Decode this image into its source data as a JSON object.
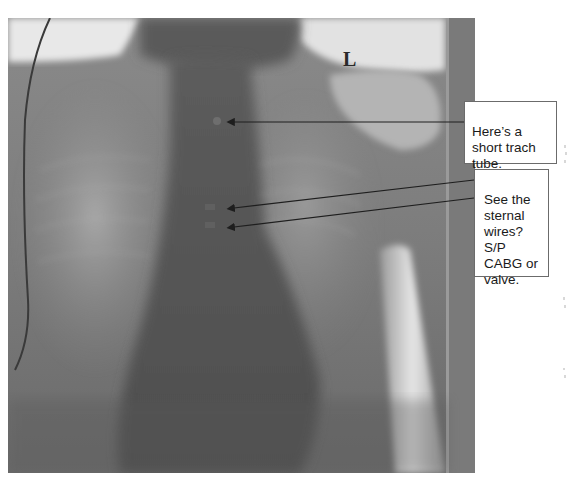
{
  "figure": {
    "side_marker": "L"
  },
  "annotations": [
    {
      "id": "trach",
      "text": "Here’s a\nshort trach\ntube.",
      "arrow_count": 1
    },
    {
      "id": "wires",
      "text": "See the\nsternal\nwires?\nS/P\nCABG or\nvalve.",
      "arrow_count": 2
    }
  ],
  "colors": {
    "background": "#ffffff",
    "callout_border": "#6b6b6b",
    "callout_text": "#1a1a1a",
    "arrow": "#1e1e1e"
  }
}
